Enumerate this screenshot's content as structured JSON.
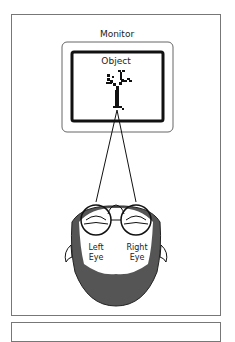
{
  "diagram": {
    "monitor_label": "Monitor",
    "object_label": "Object",
    "left_eye_label_line1": "Left",
    "left_eye_label_line2": "Eye",
    "right_eye_label_line1": "Right",
    "right_eye_label_line2": "Eye"
  },
  "colors": {
    "line": "#111111",
    "frame": "#777777",
    "beard": "#555555",
    "background": "#ffffff"
  }
}
